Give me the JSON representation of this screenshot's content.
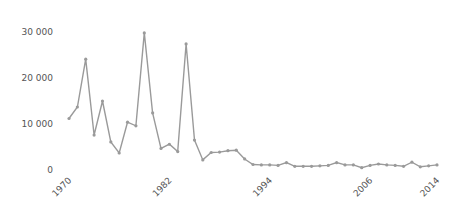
{
  "chart_data": {
    "type": "line",
    "title": "",
    "xlabel": "",
    "ylabel": "",
    "ylim": [
      0,
      30000
    ],
    "grid": false,
    "legend": null,
    "y_ticks": [
      {
        "value": 0,
        "label": "0"
      },
      {
        "value": 10000,
        "label": "10 000"
      },
      {
        "value": 20000,
        "label": "20 000"
      },
      {
        "value": 30000,
        "label": "30 000"
      }
    ],
    "x_ticks": [
      {
        "value": 1970,
        "label": "1970"
      },
      {
        "value": 1982,
        "label": "1982"
      },
      {
        "value": 1994,
        "label": "1994"
      },
      {
        "value": 2006,
        "label": "2006"
      },
      {
        "value": 2014,
        "label": "2014"
      }
    ],
    "x": [
      1970,
      1971,
      1972,
      1973,
      1974,
      1975,
      1976,
      1977,
      1978,
      1979,
      1980,
      1981,
      1982,
      1983,
      1984,
      1985,
      1986,
      1987,
      1988,
      1989,
      1990,
      1991,
      1992,
      1993,
      1994,
      1995,
      1996,
      1997,
      1998,
      1999,
      2000,
      2001,
      2002,
      2003,
      2004,
      2005,
      2006,
      2007,
      2008,
      2009,
      2010,
      2011,
      2012,
      2013,
      2014
    ],
    "series": [
      {
        "name": "series",
        "color": "#9a9a9a",
        "values": [
          11200,
          13700,
          24100,
          7600,
          15000,
          6100,
          3700,
          10400,
          9600,
          29800,
          12400,
          4700,
          5600,
          4000,
          27400,
          6500,
          2200,
          3800,
          3900,
          4200,
          4300,
          2400,
          1200,
          1100,
          1100,
          1000,
          1600,
          800,
          800,
          800,
          900,
          1000,
          1600,
          1100,
          1100,
          500,
          1000,
          1300,
          1100,
          1000,
          800,
          1700,
          700,
          900,
          1100
        ]
      }
    ]
  }
}
